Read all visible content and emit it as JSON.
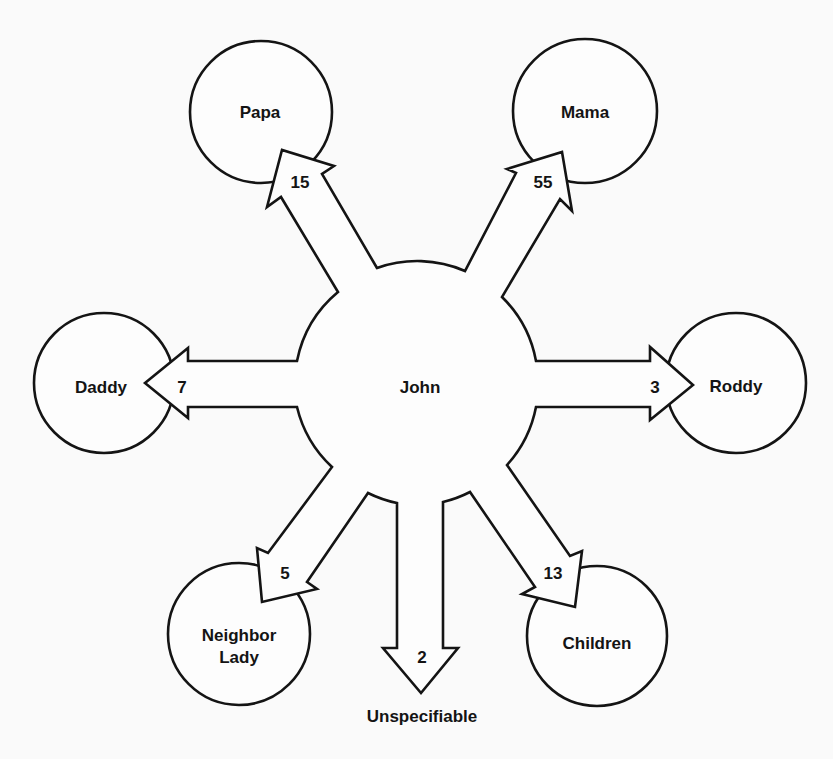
{
  "diagram": {
    "center": {
      "label": "John"
    },
    "nodes": [
      {
        "id": "papa",
        "label": "Papa",
        "value": "15"
      },
      {
        "id": "mama",
        "label": "Mama",
        "value": "55"
      },
      {
        "id": "daddy",
        "label": "Daddy",
        "value": "7"
      },
      {
        "id": "roddy",
        "label": "Roddy",
        "value": "3"
      },
      {
        "id": "neighbor-lady",
        "label_line1": "Neighbor",
        "label_line2": "Lady",
        "value": "5"
      },
      {
        "id": "unspecifiable",
        "label": "Unspecifiable",
        "value": "2"
      },
      {
        "id": "children",
        "label": "Children",
        "value": "13"
      }
    ]
  }
}
